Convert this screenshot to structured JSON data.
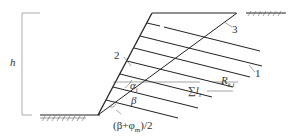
{
  "diagram": {
    "labels": {
      "height": "h",
      "anchor_1": "1",
      "face_2": "2",
      "slip_3": "3",
      "alpha": "α",
      "alpha_sub": "i",
      "beta": "β",
      "angle_formula": "(β+φm)/2",
      "angle_formula_prefix": "(β+φ",
      "angle_formula_sub": "m",
      "angle_formula_suffix": ")/2",
      "force": "R",
      "force_sub": "k,i",
      "sum_length": "∑l",
      "sum_length_sub": "i"
    },
    "colors": {
      "line": "#222222",
      "thin": "#888888"
    }
  }
}
